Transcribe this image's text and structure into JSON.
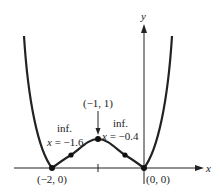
{
  "figure": {
    "axes": {
      "x_label": "x",
      "y_label": "y"
    },
    "points": [
      {
        "name": "min-left",
        "label": "(−2, 0)"
      },
      {
        "name": "max",
        "label": "(−1, 1)"
      },
      {
        "name": "min-origin",
        "label": "(0, 0)"
      }
    ],
    "inflection_left": {
      "title": "inf.",
      "eq_var": "x",
      "eq_val": " = −1.6"
    },
    "inflection_right": {
      "title": "inf.",
      "eq_var": "x",
      "eq_val": " = −0.4"
    }
  }
}
